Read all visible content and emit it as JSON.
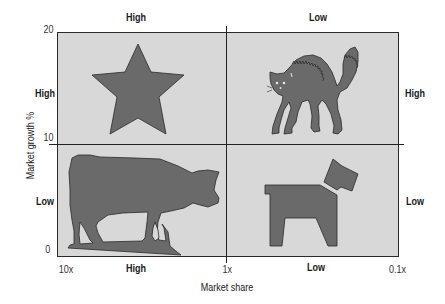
{
  "diagram": {
    "type": "BCG growth-share matrix",
    "colors": {
      "background": "#ffffff",
      "quadrant_fill": "#d8d8d8",
      "shape_fill": "#6a6a6a",
      "shape_outline": "#2a2a2a",
      "grid_line": "#222222"
    },
    "top_labels": {
      "left": "High",
      "right": "Low"
    },
    "side_labels": {
      "left_top": "High",
      "left_bottom": "Low",
      "right_top": "High",
      "right_bottom": "Low"
    },
    "bottom_labels": {
      "left": "High",
      "right": "Low"
    },
    "y_axis": {
      "title": "Market growth %",
      "ticks": [
        "20",
        "10",
        "0"
      ]
    },
    "x_axis": {
      "title": "Market share",
      "ticks": [
        "10x",
        "1x",
        "0.1x"
      ]
    },
    "quadrants": [
      {
        "position": "top-left",
        "icon": "star-icon",
        "meaning": "Star"
      },
      {
        "position": "top-right",
        "icon": "cat-icon",
        "meaning": "Question mark (wildcat)"
      },
      {
        "position": "bottom-left",
        "icon": "cow-icon",
        "meaning": "Cash cow"
      },
      {
        "position": "bottom-right",
        "icon": "dog-icon",
        "meaning": "Dog"
      }
    ]
  }
}
